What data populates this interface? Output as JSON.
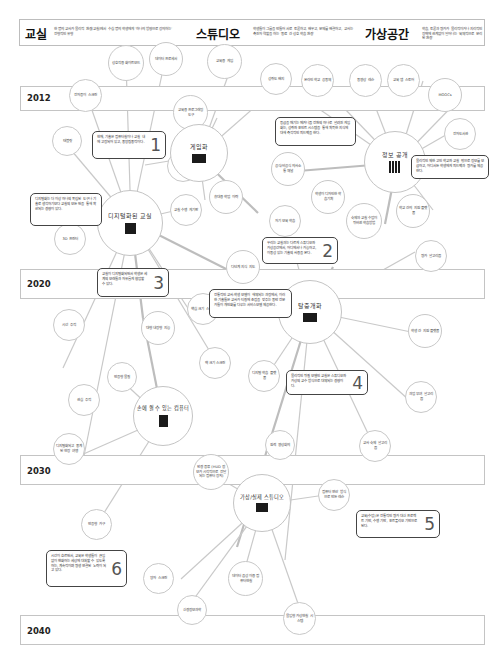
{
  "header": {
    "classroom": {
      "title": "교실",
      "desc": "한 명의 교사가 물리적 환경(교실)에서 수십 명의 학생에게 '하나의 방향으로 강의하는' 전형적인 유형"
    },
    "studio": {
      "title": "스튜디오",
      "desc": "학생들이 그룹을 만들어 서로 토론하고, 배우고, 문제를 해결하고, 교사는 촉진자 역할을 하는 '동료 간 상호 학습 환경'"
    },
    "virtual": {
      "title": "가상공간",
      "desc": "학습, 토론과 평가가 물리적이거나 지리적인 장벽에 관계없이 일어나는 '육체적으로 분리된 환경'"
    }
  },
  "years": [
    {
      "label": "2012"
    },
    {
      "label": "2020"
    },
    {
      "label": "2030"
    },
    {
      "label": "2040"
    }
  ],
  "hubs": {
    "gamification": {
      "label": "게임화"
    },
    "open_info": {
      "label": "정보 공개"
    },
    "digital_class": {
      "label": "디지털화된 교실"
    },
    "disaggregation": {
      "label": "탈중개화"
    },
    "wearable": {
      "label": "손에 쥘 수 있는 컴퓨터"
    },
    "virtual_studio": {
      "label": "가상/실제 스튜디오"
    }
  },
  "nodes": [
    {
      "id": "interactive-whiteboard",
      "label": "상호작용 화이트보드"
    },
    {
      "id": "data-processor",
      "label": "데이터 프로세서"
    },
    {
      "id": "educational-games",
      "label": "교육용 게임"
    },
    {
      "id": "achievement-badge",
      "label": "성취도 배지"
    },
    {
      "id": "online-school-community",
      "label": "온라인 학교 공동체"
    },
    {
      "id": "video-lessons",
      "label": "동영상 레슨"
    },
    {
      "id": "edu-app-store",
      "label": "교육 앱 스토어"
    },
    {
      "id": "moocs",
      "label": "MOOCs"
    },
    {
      "id": "e-paper-screen",
      "label": "전자종이 스크린"
    },
    {
      "id": "edu-programming-tools",
      "label": "교육용 프로그래밍 도구"
    },
    {
      "id": "tablet",
      "label": "태블릿"
    },
    {
      "id": "student-dev-app",
      "label": "학생 개발 앱"
    },
    {
      "id": "e-library",
      "label": "전자도서관"
    },
    {
      "id": "formal-informal-channels",
      "label": "공식/비공식 의사소통 채널"
    },
    {
      "id": "portable-learning-trace",
      "label": "휴대용 학업 이력"
    },
    {
      "id": "classroom-performance-board",
      "label": "교실 수행 게기판"
    },
    {
      "id": "self-assessment-learning",
      "label": "자기 보육 학습"
    },
    {
      "id": "student-designed-learning",
      "label": "학생이 디자인한 학습기획"
    },
    {
      "id": "flipped-classroom",
      "label": "숙제와 교실 수업이 뒤바뀐 학습방법"
    },
    {
      "id": "inter-school-platform",
      "label": "학교 간의 지원 플랫폼"
    },
    {
      "id": "3d-printer",
      "label": "3D 프린터"
    },
    {
      "id": "multi-step-guidance",
      "label": "다단계 지식 지도"
    },
    {
      "id": "assessment-algorithm",
      "label": "평가 알고리즘"
    },
    {
      "id": "core-size-screen",
      "label": "핵심 크기 스크린"
    },
    {
      "id": "peer-platform",
      "label": "학생 간 지원 플랫폼"
    },
    {
      "id": "eye-tracking",
      "label": "시선 추적"
    },
    {
      "id": "large-built-in-display",
      "label": "대형 내장형 지능"
    },
    {
      "id": "wall-size-screen",
      "label": "벽 크기 스크린"
    },
    {
      "id": "digital-learning-platform",
      "label": "디지털 학습 플랫폼"
    },
    {
      "id": "adaptive-coaching",
      "label": "반응형 물질"
    },
    {
      "id": "attention-tracking",
      "label": "관심 추적"
    },
    {
      "id": "task-algorithm",
      "label": "과업 부여 알고리즘"
    },
    {
      "id": "digital-field-trip",
      "label": "디지털화되고 중계된 현장 여행"
    },
    {
      "id": "teleconference",
      "label": "원격 영상회의"
    },
    {
      "id": "teacher-grading-algorithm",
      "label": "교사 숙제 알고리즘"
    },
    {
      "id": "hud-computer-glasses",
      "label": "안경 종류 (HUD 정보가 시각적으로 전달되는 컴퓨터 장치)"
    },
    {
      "id": "computer-generated-lessons",
      "label": "컴퓨터 연산 방식으로 만든 레슨"
    },
    {
      "id": "responsive-furniture",
      "label": "반응형 가구"
    },
    {
      "id": "shape-screen",
      "label": "양자 스크린"
    },
    {
      "id": "data-based-mixed-reality",
      "label": "데이터 음성 이용 컴퓨터현실"
    },
    {
      "id": "neuro-informatics",
      "label": "신경정보과학"
    },
    {
      "id": "immersive-vr-system",
      "label": "몰입형 가상현실 시스템"
    }
  ],
  "notes": [
    {
      "num": "1",
      "text": "현재, 기술은 컴퓨터실이나 교실 내에 고정되어 있고, 중앙집중적이다."
    },
    {
      "num": "2",
      "text": "우리는 교실과는 다르게 스튜디오와 가상공간에서, 어디에서나 가능하고, 이동성 있는 기술의 사용을 본다."
    },
    {
      "num": "3",
      "text": "교실이 디지털화되면서 학생은 세계의 모래들과 자유롭게 협업할 수 있다."
    },
    {
      "num": "4",
      "text": "물리적인 뒤질 모델인 교실은 스튜디오와 가상의 교수 방식으로 대체되는 경향이다."
    },
    {
      "num": "5",
      "text": "교육(수업)은 전통적인 평가 대신 프로젝트 기반, 수행 기반, 포트폴리오 기반으로 된다."
    },
    {
      "num": "6",
      "text": "시간이 흐르면서, 교육은 학생들이 끊임없이 변화하는 세상에 대처할 수 있도록 하는, 계속적이며 평생 연결된 노력이 되고 있다."
    }
  ],
  "side_notes": [
    {
      "id": "gamification-note",
      "text": "등급을 매기는 메커니즘 전환의 하나로 알려진 게임화는, 성취와 포인트 시스템을 통해 획득한 지식에 대해 즉각적인 피드백을 한다."
    },
    {
      "id": "open-info-note",
      "text": "물리적인 제한 고인 학교와 교실 밖으로 정보를 보급하고, 어디서든 학생에게 피드백과 평가를 제공한다."
    },
    {
      "id": "digital-class-note",
      "text": "디지털화는 더 이상 하나의 독립된 도구나 기술로 생각하기보다 교실의 모든 면을 통해 확산되는 경향이 있다."
    },
    {
      "id": "disaggregation-note",
      "text": "전통적인 교사-학생 모델이 해체되는 과정에서, 이러한 기술들은 교사가 티칭에 초점을 맞추는 동안 전문가들이 개인화를 다루는 서비스모델 제공한다."
    }
  ],
  "colors": {
    "line": "#c9c9c9",
    "border": "#bdbdbd",
    "note_border": "#444444",
    "icon": "#1b1b1b"
  }
}
